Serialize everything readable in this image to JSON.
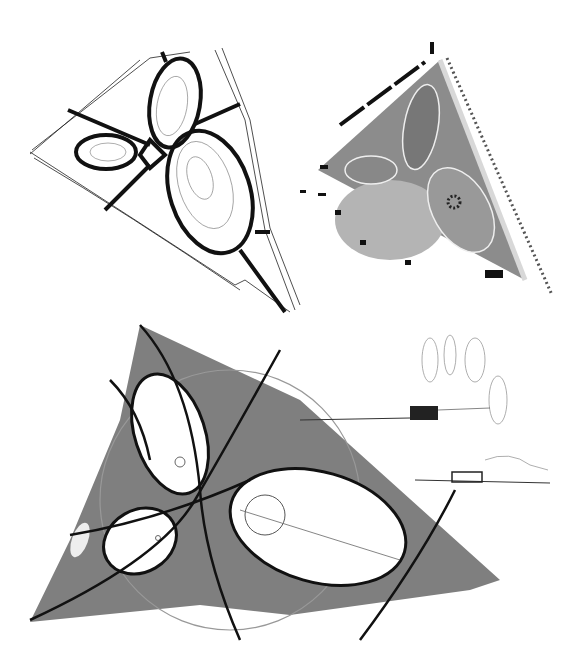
{
  "figure": {
    "panels": [
      {
        "id": "sketch-top-left",
        "kind": "ink line sketch",
        "label": ""
      },
      {
        "id": "plan-top-right",
        "kind": "rendered site plan",
        "label": ""
      },
      {
        "id": "marker-plan-bottom",
        "kind": "gray marker plan sketch",
        "label": ""
      },
      {
        "id": "section-sketches-right",
        "kind": "elevation/section sketches",
        "label": ""
      }
    ],
    "colors": {
      "ink": "#111111",
      "marker_gray": "#7f7f7f",
      "plan_green_gray": "#8c8c8c",
      "ellipse_fill_plan": "#a8a8a8",
      "paper": "#ffffff"
    }
  }
}
